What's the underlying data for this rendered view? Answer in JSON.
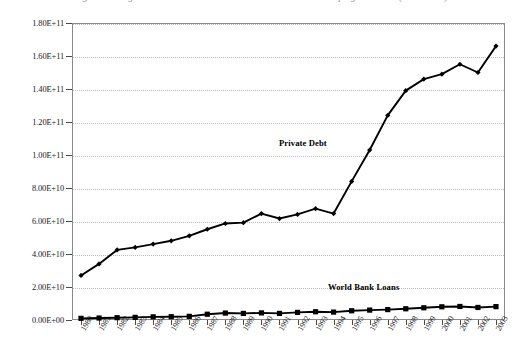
{
  "figure": {
    "title": "Figure 1:  Long-term Private Debt and World Bank Loans to Developing Countries (1980-2003)"
  },
  "chart_data": {
    "type": "line",
    "title": "",
    "xlabel": "",
    "ylabel": "",
    "grid": true,
    "legend_position": "inline-annotation",
    "x": [
      "1980",
      "1981",
      "1982",
      "1983",
      "1984",
      "1985",
      "1986",
      "1987",
      "1988",
      "1989",
      "1990",
      "1991",
      "1992",
      "1993",
      "1994",
      "1995",
      "1996",
      "1997",
      "1998",
      "1999",
      "2000",
      "2001",
      "2002",
      "2003"
    ],
    "ylim": [
      0,
      180000000000
    ],
    "ytick_values": [
      0,
      20000000000,
      40000000000,
      60000000000,
      80000000000,
      100000000000,
      120000000000,
      140000000000,
      160000000000,
      180000000000
    ],
    "ytick_labels": [
      "0.00E+00",
      "2.00E+10",
      "4.00E+10",
      "6.00E+10",
      "8.00E+10",
      "1.00E+11",
      "1.20E+11",
      "1.40E+11",
      "1.60E+11",
      "1.80E+11"
    ],
    "series": [
      {
        "name": "Private Debt",
        "marker": "diamond",
        "color": "#000000",
        "values": [
          27000000000,
          34000000000,
          42500000000,
          44000000000,
          46000000000,
          48000000000,
          51000000000,
          55000000000,
          58500000000,
          59000000000,
          64500000000,
          61500000000,
          64000000000,
          67500000000,
          64500000000,
          84000000000,
          103000000000,
          124000000000,
          139000000000,
          146000000000,
          149000000000,
          155000000000,
          150000000000,
          166000000000
        ]
      },
      {
        "name": "World Bank Loans",
        "marker": "square",
        "color": "#000000",
        "values": [
          1000000000,
          1200000000,
          1400000000,
          1600000000,
          1900000000,
          2000000000,
          2200000000,
          3500000000,
          4200000000,
          4000000000,
          4300000000,
          4000000000,
          4600000000,
          5000000000,
          4800000000,
          5600000000,
          6000000000,
          6300000000,
          6800000000,
          7400000000,
          8000000000,
          8200000000,
          7600000000,
          8100000000
        ]
      }
    ],
    "annotations": [
      {
        "text": "Private Debt",
        "x": "1992",
        "y": 116000000000
      },
      {
        "text": "World Bank Loans",
        "x": "1997",
        "y": 23000000000
      }
    ]
  }
}
